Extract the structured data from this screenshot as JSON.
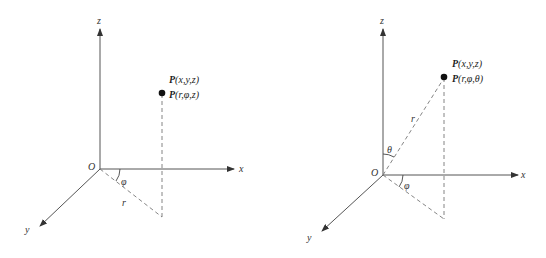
{
  "diagrams": [
    {
      "name": "cylindrical-coordinates",
      "axes": {
        "x": "x",
        "y": "y",
        "z": "z",
        "origin": "O"
      },
      "point_labels": [
        "P(x,y,z)",
        "P(r,φ,z)"
      ],
      "point_label_1": {
        "P": "P",
        "args": "(x,y,z)"
      },
      "point_label_2": {
        "P": "P",
        "args": "(r,φ,z)"
      },
      "angle_labels": {
        "phi": "φ"
      },
      "length_labels": {
        "r": "r"
      }
    },
    {
      "name": "spherical-coordinates",
      "axes": {
        "x": "x",
        "y": "y",
        "z": "z",
        "origin": "O"
      },
      "point_labels": [
        "P(x,y,z)",
        "P(r,φ,θ)"
      ],
      "point_label_1": {
        "P": "P",
        "args": "(x,y,z)"
      },
      "point_label_2": {
        "P": "P",
        "args": "(r,φ,θ)"
      },
      "angle_labels": {
        "phi": "φ",
        "theta": "θ"
      },
      "length_labels": {
        "r": "r"
      }
    }
  ]
}
